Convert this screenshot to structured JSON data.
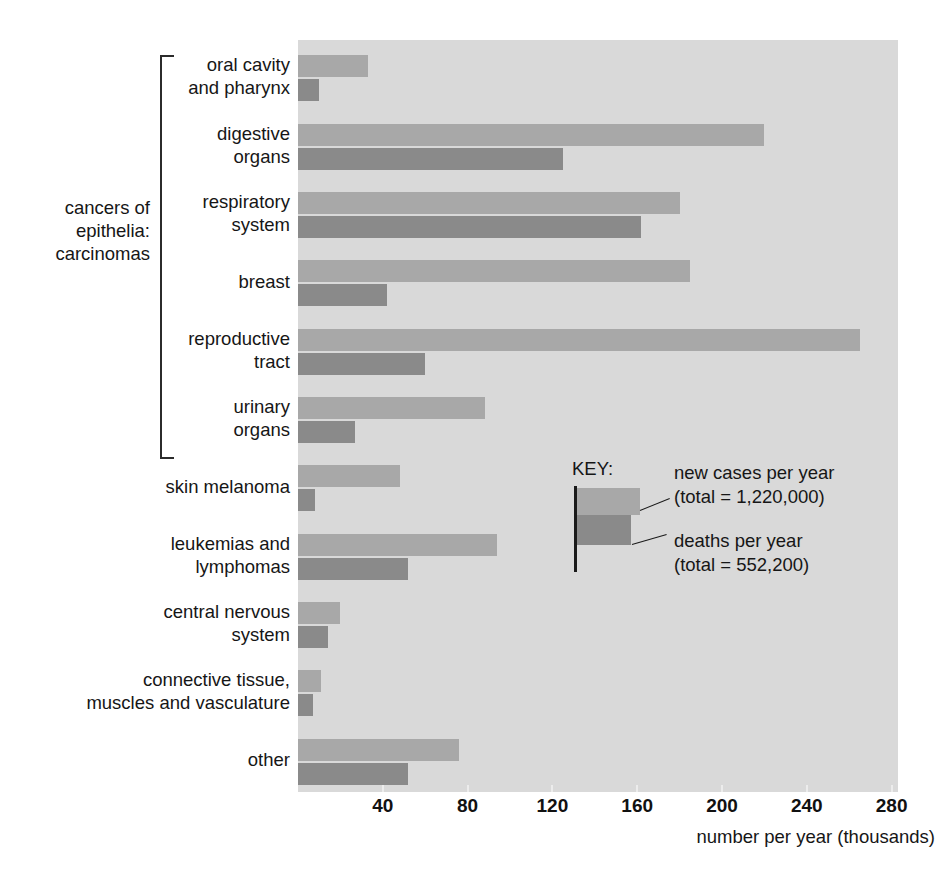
{
  "chart_data": {
    "type": "bar",
    "orientation": "horizontal",
    "title": "",
    "xlabel": "number per year (thousands)",
    "ylabel": "",
    "xlim": [
      0,
      283
    ],
    "xticks": [
      40,
      80,
      120,
      160,
      200,
      240,
      280
    ],
    "xticklabels": [
      "40",
      "80",
      "120",
      "160",
      "200",
      "240",
      "280"
    ],
    "grid": false,
    "legend_position": "inside-right",
    "categories": [
      "oral cavity\nand pharynx",
      "digestive\norgans",
      "respiratory\nsystem",
      "breast",
      "reproductive\ntract",
      "urinary\norgans",
      "skin melanoma",
      "leukemias and\nlymphomas",
      "central nervous\nsystem",
      "connective tissue,\nmuscles and vasculature",
      "other"
    ],
    "series": [
      {
        "name": "new cases per year",
        "color": "#a8a8a8",
        "values": [
          33,
          220,
          180,
          185,
          265,
          88,
          48,
          94,
          20,
          11,
          76
        ]
      },
      {
        "name": "deaths per year",
        "color": "#8a8a8a",
        "values": [
          10,
          125,
          162,
          42,
          60,
          27,
          8,
          52,
          14,
          7,
          52
        ]
      }
    ]
  },
  "axis": {
    "x_title": "number per year (thousands)",
    "ticks": [
      {
        "label": "40",
        "value": 40
      },
      {
        "label": "80",
        "value": 80
      },
      {
        "label": "120",
        "value": 120
      },
      {
        "label": "160",
        "value": 160
      },
      {
        "label": "200",
        "value": 200
      },
      {
        "label": "240",
        "value": 240
      },
      {
        "label": "280",
        "value": 280
      }
    ]
  },
  "bracket": {
    "label": "cancers of\nepithelia:\ncarcinomas",
    "covers": [
      "oral cavity and pharynx",
      "digestive organs",
      "respiratory system",
      "breast",
      "reproductive tract",
      "urinary organs"
    ]
  },
  "key": {
    "title": "KEY:",
    "new_cases": "new cases per year\n(total = 1,220,000)",
    "deaths": "deaths per year\n(total = 552,200)",
    "new_cases_color": "#a8a8a8",
    "deaths_color": "#8a8a8a"
  },
  "colors": {
    "plot_background": "#d9d9d9",
    "page_background": "#ffffff",
    "text": "#161616"
  }
}
